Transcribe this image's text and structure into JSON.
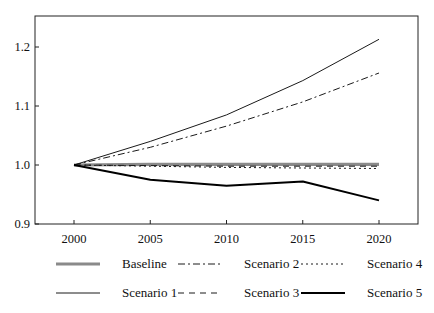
{
  "chart_data": {
    "type": "line",
    "title": "",
    "xlabel": "",
    "ylabel": "",
    "x": [
      2000,
      2005,
      2010,
      2015,
      2020
    ],
    "xlim": [
      1997.5,
      2022.5
    ],
    "ylim": [
      0.9,
      1.25
    ],
    "xticks": [
      "2000",
      "2005",
      "2010",
      "2015",
      "2020"
    ],
    "yticks": [
      "0.9",
      "1.0",
      "1.1",
      "1.2"
    ],
    "grid": false,
    "legend_position": "bottom",
    "series": [
      {
        "name": "Baseline",
        "values": [
          1.0,
          1.001,
          1.001,
          1.001,
          1.001
        ],
        "style": "solid",
        "color": "#8a8a8a",
        "width": 3.2
      },
      {
        "name": "Scenario 1",
        "values": [
          1.0,
          1.04,
          1.085,
          1.143,
          1.213
        ],
        "style": "solid",
        "color": "#1a1a1a",
        "width": 1.0
      },
      {
        "name": "Scenario 2",
        "values": [
          1.0,
          1.03,
          1.066,
          1.107,
          1.156
        ],
        "style": "dashdot",
        "color": "#1a1a1a",
        "width": 1.0
      },
      {
        "name": "Scenario 3",
        "values": [
          1.0,
          0.999,
          0.998,
          0.998,
          0.998
        ],
        "style": "dashed",
        "color": "#1a1a1a",
        "width": 1.0
      },
      {
        "name": "Scenario 4",
        "values": [
          1.0,
          0.998,
          0.996,
          0.995,
          0.994
        ],
        "style": "dotted",
        "color": "#1a1a1a",
        "width": 1.0
      },
      {
        "name": "Scenario 5",
        "values": [
          1.0,
          0.975,
          0.965,
          0.972,
          0.94
        ],
        "style": "solid",
        "color": "#000000",
        "width": 2.0
      }
    ]
  },
  "legend": {
    "items": [
      {
        "label": "Baseline"
      },
      {
        "label": "Scenario 1"
      },
      {
        "label": "Scenario 2"
      },
      {
        "label": "Scenario 3"
      },
      {
        "label": "Scenario 4"
      },
      {
        "label": "Scenario 5"
      }
    ]
  }
}
